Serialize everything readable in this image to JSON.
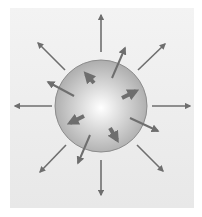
{
  "diagram": {
    "title": "",
    "colors": {
      "background": "#ffffff",
      "panel": "#ededed",
      "sphere_light": "#ffffff",
      "sphere_dark": "#a8a8a8",
      "sphere_edge": "#8c8c8c",
      "arrow": "#6e6e6e"
    },
    "sphere": {
      "cx": 101,
      "cy": 106,
      "r": 46
    },
    "outer_arrows": [
      {
        "name": "up",
        "x1": 101,
        "y1": 52,
        "x2": 101,
        "y2": 15
      },
      {
        "name": "down",
        "x1": 101,
        "y1": 160,
        "x2": 101,
        "y2": 195
      },
      {
        "name": "left",
        "x1": 52,
        "y1": 106,
        "x2": 15,
        "y2": 106
      },
      {
        "name": "right",
        "x1": 152,
        "y1": 106,
        "x2": 190,
        "y2": 106
      },
      {
        "name": "up-left",
        "x1": 65,
        "y1": 70,
        "x2": 38,
        "y2": 43
      },
      {
        "name": "up-right",
        "x1": 138,
        "y1": 70,
        "x2": 165,
        "y2": 44
      },
      {
        "name": "down-left",
        "x1": 66,
        "y1": 145,
        "x2": 40,
        "y2": 172
      },
      {
        "name": "down-right",
        "x1": 137,
        "y1": 145,
        "x2": 163,
        "y2": 171
      }
    ],
    "crossing_arrows": [
      {
        "name": "upper-right-crossing",
        "x1": 112,
        "y1": 78,
        "x2": 125,
        "y2": 48
      },
      {
        "name": "left-crossing",
        "x1": 74,
        "y1": 96,
        "x2": 48,
        "y2": 82
      },
      {
        "name": "right-lower-crossing",
        "x1": 130,
        "y1": 118,
        "x2": 158,
        "y2": 131
      },
      {
        "name": "lower-crossing",
        "x1": 90,
        "y1": 135,
        "x2": 78,
        "y2": 163
      }
    ],
    "inner_arrows": [
      {
        "name": "inner-upper-left",
        "x1": 94,
        "y1": 83,
        "x2": 86,
        "y2": 74
      },
      {
        "name": "inner-right",
        "x1": 122,
        "y1": 98,
        "x2": 136,
        "y2": 91
      },
      {
        "name": "inner-left",
        "x1": 84,
        "y1": 116,
        "x2": 70,
        "y2": 123
      },
      {
        "name": "inner-lower",
        "x1": 110,
        "y1": 128,
        "x2": 117,
        "y2": 140
      }
    ]
  }
}
